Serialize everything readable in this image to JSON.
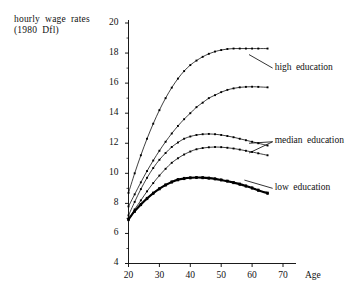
{
  "chart_data": {
    "type": "line",
    "title": "",
    "xlabel": "Age",
    "ylabel": "hourly wage rates\n(1980 Dfl)",
    "xlim": [
      18,
      72
    ],
    "ylim": [
      3.4,
      20.6
    ],
    "xticks": [
      20,
      30,
      40,
      50,
      60,
      70
    ],
    "yticks": [
      4,
      6,
      8,
      10,
      12,
      14,
      16,
      18,
      20
    ],
    "yminorticks": [
      5,
      7,
      9,
      11,
      13,
      15,
      17,
      19
    ],
    "grid": false,
    "legend_position": "inline-right",
    "marker": "square",
    "x": [
      20,
      22,
      24,
      26,
      28,
      30,
      32,
      34,
      36,
      38,
      40,
      42,
      44,
      46,
      48,
      50,
      52,
      54,
      56,
      58,
      60,
      62,
      65
    ],
    "series": [
      {
        "name": "high education upper",
        "label_group": "high education",
        "values": [
          8.7,
          10.0,
          11.2,
          12.3,
          13.3,
          14.2,
          15.0,
          15.7,
          16.3,
          16.8,
          17.2,
          17.5,
          17.75,
          17.95,
          18.1,
          18.2,
          18.27,
          18.3,
          18.3,
          18.3,
          18.3,
          18.3,
          18.3
        ]
      },
      {
        "name": "high education lower",
        "label_group": "high education",
        "values": [
          7.8,
          8.6,
          9.4,
          10.15,
          10.85,
          11.5,
          12.1,
          12.65,
          13.15,
          13.6,
          14.0,
          14.4,
          14.7,
          15.0,
          15.2,
          15.4,
          15.55,
          15.65,
          15.72,
          15.75,
          15.76,
          15.75,
          15.72
        ]
      },
      {
        "name": "median education upper",
        "label_group": "median education",
        "values": [
          7.2,
          8.1,
          8.95,
          9.7,
          10.35,
          10.9,
          11.35,
          11.75,
          12.05,
          12.3,
          12.45,
          12.55,
          12.6,
          12.62,
          12.6,
          12.55,
          12.48,
          12.4,
          12.3,
          12.2,
          12.1,
          12.0,
          11.85
        ]
      },
      {
        "name": "median education lower",
        "label_group": "median education",
        "values": [
          7.0,
          7.6,
          8.2,
          8.8,
          9.35,
          9.85,
          10.3,
          10.7,
          11.0,
          11.25,
          11.45,
          11.6,
          11.68,
          11.73,
          11.75,
          11.74,
          11.7,
          11.65,
          11.58,
          11.5,
          11.42,
          11.33,
          11.2
        ]
      },
      {
        "name": "low education upper",
        "label_group": "low education",
        "values": [
          6.95,
          7.5,
          7.95,
          8.35,
          8.7,
          9.0,
          9.25,
          9.45,
          9.6,
          9.68,
          9.72,
          9.74,
          9.73,
          9.7,
          9.65,
          9.58,
          9.5,
          9.4,
          9.3,
          9.18,
          9.05,
          8.9,
          8.7
        ]
      },
      {
        "name": "low education lower",
        "label_group": "low education",
        "values": [
          6.9,
          7.45,
          7.9,
          8.3,
          8.65,
          8.95,
          9.2,
          9.4,
          9.55,
          9.63,
          9.68,
          9.7,
          9.69,
          9.66,
          9.61,
          9.54,
          9.46,
          9.36,
          9.25,
          9.13,
          9.0,
          8.85,
          8.65
        ]
      }
    ],
    "annotations": [
      {
        "text": "high education",
        "x": 66,
        "y": 17.0
      },
      {
        "text": "median education",
        "x": 66,
        "y": 12.1
      },
      {
        "text": "low education",
        "x": 66,
        "y": 9.0
      }
    ]
  },
  "labels": {
    "y_axis_title": "hourly wage rates\n(1980 Dfl)",
    "x_axis_title": "Age",
    "high_education": "high education",
    "median_education": "median education",
    "low_education": "low education"
  },
  "colors": {
    "axis": "#000000",
    "curve": "#000000",
    "background": "#ffffff"
  }
}
